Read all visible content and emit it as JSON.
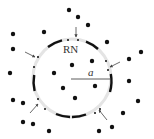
{
  "diagram": {
    "labels": {
      "center_label": "RN",
      "radius_label": "a"
    },
    "colors": {
      "dot": "#111111",
      "ring": "#e4e4e4",
      "segment": "#111111",
      "arrow": "#444444",
      "text": "#333333"
    },
    "circle": {
      "cx": 72,
      "cy": 78,
      "r": 39
    },
    "outside_dots": [
      [
        69,
        10
      ],
      [
        78,
        17
      ],
      [
        88,
        25
      ],
      [
        13,
        34
      ],
      [
        44,
        32
      ],
      [
        107,
        42
      ],
      [
        13,
        49
      ],
      [
        141,
        52
      ],
      [
        129,
        59
      ],
      [
        10,
        73
      ],
      [
        129,
        81
      ],
      [
        13,
        100
      ],
      [
        23,
        103
      ],
      [
        138,
        101
      ],
      [
        123,
        113
      ],
      [
        23,
        122
      ],
      [
        33,
        124
      ],
      [
        112,
        127
      ],
      [
        49,
        131
      ],
      [
        99,
        131
      ]
    ],
    "inside_dots": [
      [
        72,
        65
      ],
      [
        92,
        61
      ],
      [
        54,
        73
      ],
      [
        95,
        86
      ],
      [
        63,
        88
      ],
      [
        75,
        98
      ]
    ],
    "ring_small_dots": [
      [
        68,
        40
      ],
      [
        78,
        40
      ],
      [
        38,
        57
      ],
      [
        34,
        67
      ],
      [
        106,
        61
      ],
      [
        108,
        70
      ],
      [
        38,
        99
      ],
      [
        45,
        109
      ],
      [
        100,
        109
      ],
      [
        95,
        113
      ]
    ],
    "arrows": [
      {
        "from": [
          76,
          27
        ],
        "to": [
          76,
          37
        ]
      },
      {
        "from": [
          25,
          52
        ],
        "to": [
          35,
          57
        ]
      },
      {
        "from": [
          120,
          62
        ],
        "to": [
          110,
          67
        ]
      },
      {
        "from": [
          30,
          113
        ],
        "to": [
          38,
          104
        ]
      },
      {
        "from": [
          107,
          120
        ],
        "to": [
          99,
          110
        ]
      }
    ]
  }
}
